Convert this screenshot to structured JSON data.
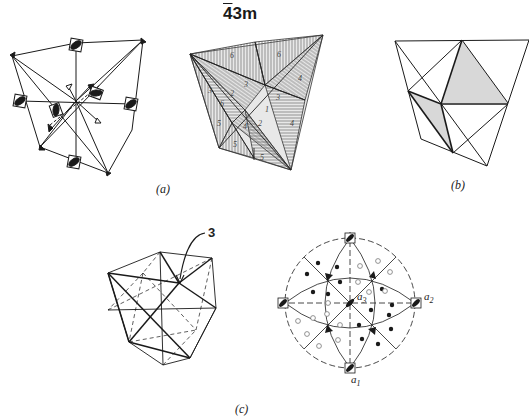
{
  "title": {
    "bar_digit": "4",
    "rest": "3m"
  },
  "captions": {
    "a": "(a)",
    "b": "(b)",
    "c": "(c)"
  },
  "annotations": {
    "threefold_axis_label": "3",
    "stereogram_axes": {
      "a1": "a",
      "a1_sub": "1",
      "a2": "a",
      "a2_sub": "2",
      "a3": "a",
      "a3_sub": "3"
    }
  },
  "face_numbers": {
    "n6a": "6",
    "n6b": "6",
    "n4a": "4",
    "n4b": "4",
    "n3a": "3",
    "n3b": "3",
    "n3c": "3",
    "n2a": "2",
    "n2b": "2",
    "n1": "1",
    "n6c": "6",
    "n4c": "4",
    "n5a": "5",
    "n5b": "5",
    "n5c": "5"
  },
  "colors": {
    "ink": "#1a1a1a",
    "shade": "#d8d8d8",
    "background": "#ffffff"
  }
}
